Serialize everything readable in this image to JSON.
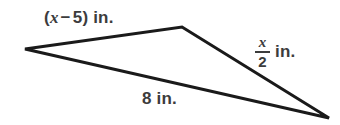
{
  "figure": {
    "type": "geometry-diagram",
    "shape": "triangle",
    "background_color": "#ffffff",
    "stroke_color": "#1a1a1a",
    "stroke_width": 3,
    "label_color": "#3c3c3c",
    "vertices": [
      {
        "name": "left-vertex",
        "x": 25,
        "y": 49
      },
      {
        "name": "top-vertex",
        "x": 182,
        "y": 27
      },
      {
        "name": "right-vertex",
        "x": 329,
        "y": 118
      }
    ],
    "path": "M 25 49 L 182 27 L 329 118 Z",
    "labels": {
      "top_side": {
        "open_paren": "(",
        "variable": "x",
        "operator": "−",
        "constant": "5",
        "close_paren": ")",
        "unit": "in.",
        "full_text": "(x − 5) in."
      },
      "bottom_side": {
        "value": "8",
        "unit": "in.",
        "full_text": "8 in."
      },
      "right_side": {
        "numerator": "x",
        "denominator": "2",
        "unit": "in.",
        "full_text": "x/2 in."
      }
    }
  }
}
